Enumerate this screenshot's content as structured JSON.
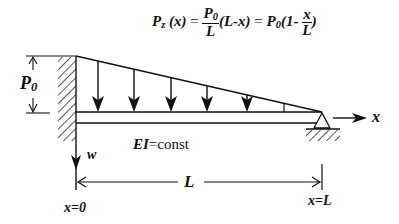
{
  "figure": {
    "type": "beam-load-diagram",
    "formula": {
      "lhs": "P",
      "lhs_sub": "z",
      "lhs_arg": "(x)",
      "eq1": "=",
      "frac1_num": "P",
      "frac1_num_sub": "0",
      "frac1_den": "L",
      "term1": "(L-x)",
      "eq2": "=",
      "coef": "P",
      "coef_sub": "0",
      "paren_open": "(1-",
      "frac2_num": "x",
      "frac2_den": "L",
      "paren_close": ")"
    },
    "load_label": "P",
    "load_label_sub": "0",
    "stiffness_label": "EI=const",
    "stiffness_label_italic": "EI",
    "stiffness_label_rest": "=const",
    "x_axis_label": "x",
    "w_axis_label": "w",
    "span_label": "L",
    "left_end_label": "x=0",
    "right_end_label": "x=L",
    "colors": {
      "ink": "#111111",
      "background": "#ffffff"
    },
    "load_arrow_positions_x": [
      98,
      134,
      170,
      206,
      245,
      282
    ]
  }
}
